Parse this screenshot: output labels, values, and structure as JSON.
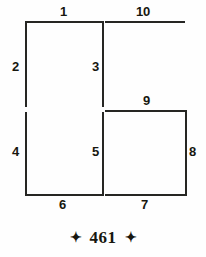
{
  "figure": {
    "title": "",
    "background_color": "#fefefe",
    "line_color": "#262623",
    "label_color": "#17170f",
    "segments": [
      {
        "id": "1",
        "name": "segment-1",
        "orientation": "horizontal",
        "x": 25,
        "y": 21,
        "length": 77
      },
      {
        "id": "10",
        "name": "segment-10",
        "orientation": "horizontal",
        "x": 105,
        "y": 21,
        "length": 80
      },
      {
        "id": "2",
        "name": "segment-2",
        "orientation": "vertical",
        "x": 25,
        "y": 21,
        "length": 86
      },
      {
        "id": "3",
        "name": "segment-3",
        "orientation": "vertical",
        "x": 102,
        "y": 21,
        "length": 86
      },
      {
        "id": "9",
        "name": "segment-9",
        "orientation": "horizontal",
        "x": 105,
        "y": 110,
        "length": 80
      },
      {
        "id": "4",
        "name": "segment-4",
        "orientation": "vertical",
        "x": 25,
        "y": 112,
        "length": 84
      },
      {
        "id": "5",
        "name": "segment-5",
        "orientation": "vertical",
        "x": 102,
        "y": 112,
        "length": 84
      },
      {
        "id": "8",
        "name": "segment-8",
        "orientation": "vertical",
        "x": 185,
        "y": 110,
        "length": 86
      },
      {
        "id": "6",
        "name": "segment-6",
        "orientation": "horizontal",
        "x": 25,
        "y": 194,
        "length": 77
      },
      {
        "id": "7",
        "name": "segment-7",
        "orientation": "horizontal",
        "x": 105,
        "y": 194,
        "length": 80
      }
    ],
    "labels": [
      {
        "text": "1",
        "name": "label-1",
        "x": 60,
        "y": 5
      },
      {
        "text": "10",
        "name": "label-10",
        "x": 136,
        "y": 5
      },
      {
        "text": "2",
        "name": "label-2",
        "x": 12,
        "y": 60
      },
      {
        "text": "3",
        "name": "label-3",
        "x": 92,
        "y": 60
      },
      {
        "text": "9",
        "name": "label-9",
        "x": 143,
        "y": 94
      },
      {
        "text": "4",
        "name": "label-4",
        "x": 12,
        "y": 145
      },
      {
        "text": "5",
        "name": "label-5",
        "x": 92,
        "y": 145
      },
      {
        "text": "8",
        "name": "label-8",
        "x": 189,
        "y": 145
      },
      {
        "text": "6",
        "name": "label-6",
        "x": 59,
        "y": 198
      },
      {
        "text": "7",
        "name": "label-7",
        "x": 141,
        "y": 198
      }
    ]
  },
  "footer": {
    "left_ornament": "✦",
    "page_number": "461",
    "right_ornament": "✦",
    "ornament_icon_name": "four-pointed-star-icon"
  }
}
